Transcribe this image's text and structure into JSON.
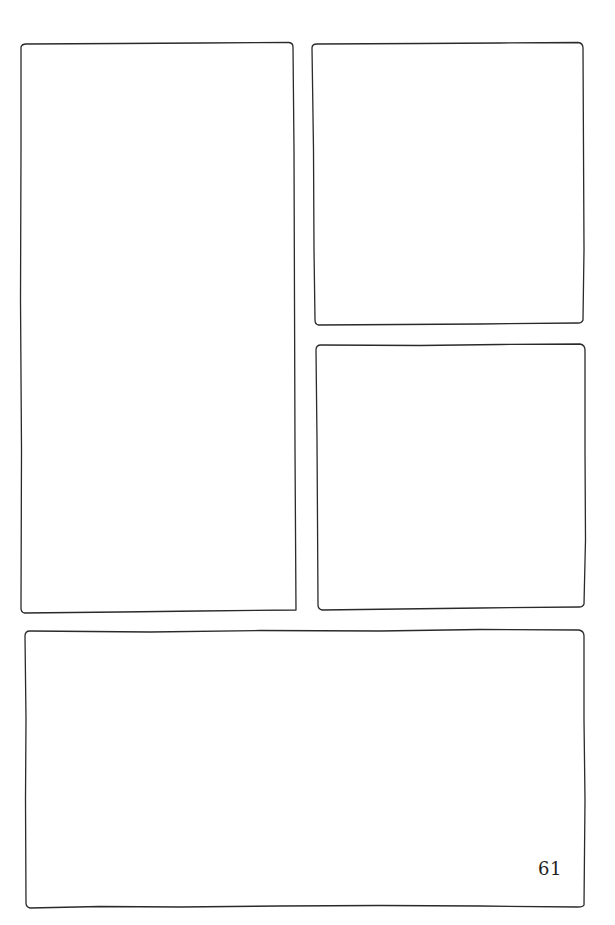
{
  "page": {
    "type": "comic-page-panel-template",
    "background_color": "#ffffff",
    "ink_color": "#2a2a2a",
    "page_number": "61"
  },
  "panels": [
    {
      "id": "panel-1",
      "label": "tall left panel",
      "x": 20,
      "y": 43,
      "w": 277,
      "h": 569
    },
    {
      "id": "panel-2",
      "label": "top right panel",
      "x": 311,
      "y": 43,
      "w": 274,
      "h": 282
    },
    {
      "id": "panel-3",
      "label": "middle right panel",
      "x": 316,
      "y": 345,
      "w": 269,
      "h": 265
    },
    {
      "id": "panel-4",
      "label": "bottom wide panel",
      "x": 24,
      "y": 630,
      "w": 561,
      "h": 278
    }
  ]
}
